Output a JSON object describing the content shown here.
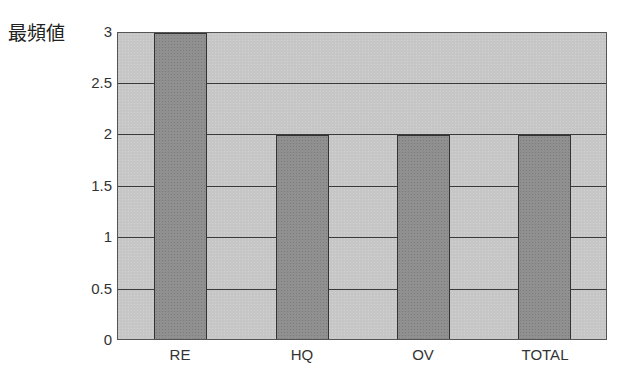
{
  "chart_data": {
    "type": "bar",
    "title": "",
    "xlabel": "",
    "ylabel": "最頻値",
    "categories": [
      "RE",
      "HQ",
      "OV",
      "TOTAL"
    ],
    "values": [
      3,
      2,
      2,
      2
    ],
    "ylim": [
      0,
      3
    ],
    "yticks": [
      "0",
      "0.5",
      "1",
      "1.5",
      "2",
      "2.5",
      "3"
    ],
    "grid": true,
    "legend": null,
    "colors": {
      "bar": "#909090",
      "background": "#c6c6c6",
      "gridline": "#3a3a3a"
    }
  },
  "labels": {
    "ylabel": "最頻値",
    "yticks": [
      "0",
      "0.5",
      "1",
      "1.5",
      "2",
      "2.5",
      "3"
    ],
    "categories": [
      "RE",
      "HQ",
      "OV",
      "TOTAL"
    ]
  }
}
